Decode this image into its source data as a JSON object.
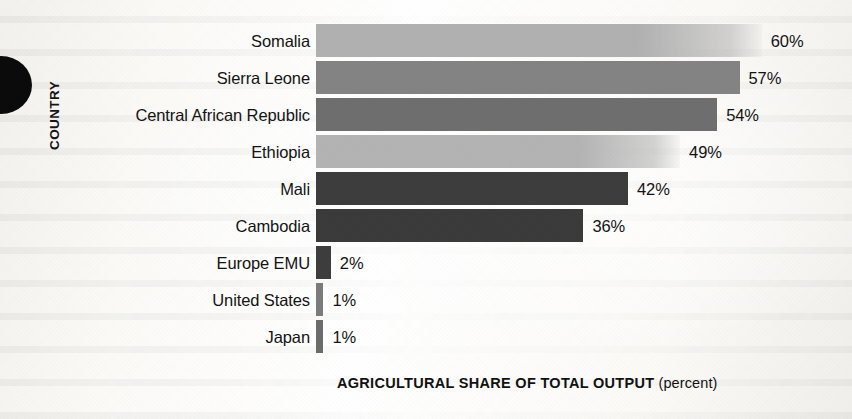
{
  "chart_data": {
    "type": "bar",
    "orientation": "horizontal",
    "title": "",
    "xlabel": "AGRICULTURAL SHARE OF TOTAL OUTPUT",
    "xlabel_unit": "(percent)",
    "ylabel": "COUNTRY",
    "categories": [
      "Somalia",
      "Sierra Leone",
      "Central African Republic",
      "Ethiopia",
      "Mali",
      "Cambodia",
      "Europe EMU",
      "United States",
      "Japan"
    ],
    "values": [
      60,
      57,
      54,
      49,
      42,
      36,
      2,
      1,
      1
    ],
    "value_labels": [
      "60%",
      "57%",
      "54%",
      "49%",
      "42%",
      "36%",
      "2%",
      "1%",
      "1%"
    ],
    "bar_colors": [
      "#b0b0b0",
      "#838383",
      "#6e6e6e",
      "#b3b3b3",
      "#3c3c3c",
      "#3a3a3a",
      "#3d3d3d",
      "#7b7b7b",
      "#6b6b6b"
    ],
    "xlim": [
      0,
      60
    ],
    "grid": false,
    "legend": null
  },
  "axis": {
    "y_title": "COUNTRY",
    "x_title_bold": "AGRICULTURAL SHARE OF TOTAL OUTPUT",
    "x_title_unit": "(percent)"
  },
  "rows": [
    {
      "label": "Somalia",
      "value": 60,
      "value_label": "60%",
      "color": "#b0b0b0"
    },
    {
      "label": "Sierra Leone",
      "value": 57,
      "value_label": "57%",
      "color": "#838383"
    },
    {
      "label": "Central African Republic",
      "value": 54,
      "value_label": "54%",
      "color": "#6e6e6e"
    },
    {
      "label": "Ethiopia",
      "value": 49,
      "value_label": "49%",
      "color": "#b3b3b3"
    },
    {
      "label": "Mali",
      "value": 42,
      "value_label": "42%",
      "color": "#3c3c3c"
    },
    {
      "label": "Cambodia",
      "value": 36,
      "value_label": "36%",
      "color": "#3a3a3a"
    },
    {
      "label": "Europe EMU",
      "value": 2,
      "value_label": "2%",
      "color": "#3d3d3d"
    },
    {
      "label": "United States",
      "value": 1,
      "value_label": "1%",
      "color": "#7b7b7b"
    },
    {
      "label": "Japan",
      "value": 1,
      "value_label": "1%",
      "color": "#6b6b6b"
    }
  ],
  "layout": {
    "bar_origin_x": 316,
    "px_per_percent": 7.43,
    "first_row_top": 22,
    "row_pitch": 37,
    "value_gap": 9
  }
}
